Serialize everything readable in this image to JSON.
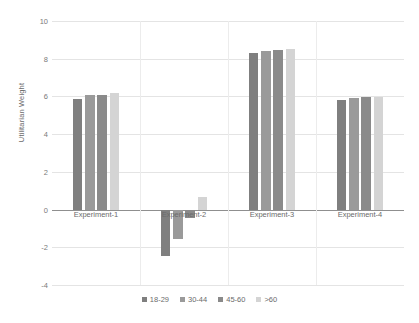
{
  "chart_data": {
    "type": "bar",
    "title": "",
    "xlabel": "",
    "ylabel": "Utilitarian Weight",
    "ylim": [
      -4,
      10
    ],
    "yticks": [
      10,
      8,
      6,
      4,
      2,
      0,
      -2,
      -4
    ],
    "grid": true,
    "legend_position": "bottom",
    "categories": [
      "Experiment-1",
      "Experiment-2",
      "Experiment-3",
      "Experiment-4"
    ],
    "series": [
      {
        "name": "18-29",
        "color": "#7f7f7f",
        "values": [
          5.85,
          -2.45,
          8.3,
          5.8
        ]
      },
      {
        "name": "30-44",
        "color": "#9a9a9a",
        "values": [
          6.05,
          -1.55,
          8.4,
          5.9
        ]
      },
      {
        "name": "45-60",
        "color": "#8a8a8a",
        "values": [
          6.1,
          -0.45,
          8.45,
          5.95
        ]
      },
      {
        "name": ">60",
        "color": "#d4d4d4",
        "values": [
          6.2,
          0.65,
          8.5,
          5.95
        ]
      }
    ]
  },
  "axis": {
    "y_title": "Utilitarian Weight",
    "y_labels": [
      "10",
      "8",
      "6",
      "4",
      "2",
      "0",
      "-2",
      "-4"
    ],
    "x_labels": [
      "Experiment-1",
      "Experiment-2",
      "Experiment-3",
      "Experiment-4"
    ]
  },
  "legend": {
    "items": [
      {
        "label": "18-29",
        "color": "#7f7f7f"
      },
      {
        "label": "30-44",
        "color": "#9a9a9a"
      },
      {
        "label": "45-60",
        "color": "#8a8a8a"
      },
      {
        "label": ">60",
        "color": "#d4d4d4"
      }
    ]
  }
}
